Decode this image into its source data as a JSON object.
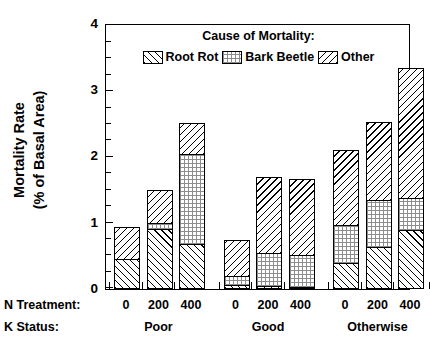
{
  "chart_data": {
    "type": "bar",
    "subtype": "stacked",
    "title": "",
    "xlabel": "",
    "ylabel": "Mortality Rate (% of Basal Area)",
    "ylabel_lines": [
      "Mortality Rate",
      "(% of Basal Area)"
    ],
    "ylim": [
      0,
      4
    ],
    "yticks": [
      0,
      1,
      2,
      3,
      4
    ],
    "ytick_labels": [
      "0",
      "1",
      "2",
      "3",
      "4"
    ],
    "yminor_step": 0.25,
    "grid": false,
    "legend_title": "Cause of Mortality:",
    "legend_position": "top-center-inside",
    "categories": [
      "0",
      "200",
      "400",
      "0",
      "200",
      "400",
      "0",
      "200",
      "400"
    ],
    "group_label": "K Status:",
    "category_label": "N Treatment:",
    "groups": [
      {
        "name": "Poor",
        "categories": [
          "0",
          "200",
          "400"
        ]
      },
      {
        "name": "Good",
        "categories": [
          "0",
          "200",
          "400"
        ]
      },
      {
        "name": "Otherwise",
        "categories": [
          "0",
          "200",
          "400"
        ]
      }
    ],
    "series": [
      {
        "name": "Root Rot",
        "fill": "diagonal-hatch-forward",
        "values": [
          0.45,
          0.9,
          0.67,
          0.05,
          0.03,
          0.02,
          0.39,
          0.63,
          0.88
        ]
      },
      {
        "name": "Bark Beetle",
        "fill": "fine-grid",
        "values": [
          0.0,
          0.1,
          1.38,
          0.14,
          0.51,
          0.49,
          0.57,
          0.72,
          0.5
        ]
      },
      {
        "name": "Other",
        "fill": "diagonal-hatch-backward",
        "values": [
          0.47,
          0.48,
          0.45,
          0.53,
          1.14,
          1.15,
          1.14,
          1.17,
          1.97
        ]
      }
    ],
    "totals": [
      0.92,
      1.48,
      2.5,
      0.72,
      1.68,
      1.66,
      2.1,
      2.52,
      3.35
    ]
  },
  "legend": {
    "title": "Cause of Mortality:",
    "items": [
      {
        "label": "Root Rot"
      },
      {
        "label": "Bark Beetle"
      },
      {
        "label": "Other"
      }
    ]
  },
  "axes": {
    "y_title_line1": "Mortality Rate",
    "y_title_line2": "(% of Basal Area)",
    "y_tick_labels": [
      "4",
      "3",
      "2",
      "1",
      "0"
    ],
    "x_row1_label": "N Treatment:",
    "x_row2_label": "K Status:",
    "x_values": [
      "0",
      "200",
      "400",
      "0",
      "200",
      "400",
      "0",
      "200",
      "400"
    ],
    "x_groups": [
      "Poor",
      "Good",
      "Otherwise"
    ]
  }
}
